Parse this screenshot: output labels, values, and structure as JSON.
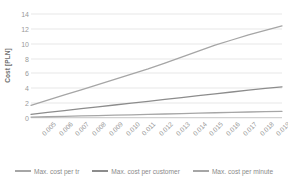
{
  "chart_data": {
    "type": "line",
    "title": "",
    "xlabel": "",
    "ylabel": "Cost [PLN]",
    "ylim": [
      0,
      14
    ],
    "yticks": [
      0,
      2,
      4,
      6,
      8,
      10,
      12,
      14
    ],
    "grid": true,
    "legend_position": "bottom",
    "categories": [
      "0.005",
      "0.006",
      "0.007",
      "0.008",
      "0.009",
      "0.010",
      "0.011",
      "0.012",
      "0.013",
      "0.014",
      "0.015",
      "0.016",
      "0.017",
      "0.018",
      "0.019",
      "0.020"
    ],
    "series": [
      {
        "name": "Max. cost per tr",
        "color": "#a6a6a6",
        "values": [
          1.7,
          2.4,
          3.1,
          3.8,
          4.5,
          5.2,
          5.9,
          6.6,
          7.4,
          8.2,
          9.0,
          9.8,
          10.5,
          11.2,
          11.8,
          12.4
        ]
      },
      {
        "name": "Max. cost per customer",
        "color": "#8c8c8c",
        "values": [
          0.5,
          0.75,
          1.0,
          1.25,
          1.5,
          1.75,
          2.0,
          2.25,
          2.5,
          2.75,
          3.0,
          3.25,
          3.5,
          3.75,
          4.0,
          4.2
        ]
      },
      {
        "name": "Max. cost per minute",
        "color": "#a6a6a6",
        "values": [
          0.12,
          0.17,
          0.22,
          0.28,
          0.33,
          0.38,
          0.43,
          0.48,
          0.54,
          0.6,
          0.66,
          0.71,
          0.76,
          0.81,
          0.86,
          0.9
        ]
      }
    ]
  },
  "axes": {
    "y_title": "Cost [PLN]"
  }
}
